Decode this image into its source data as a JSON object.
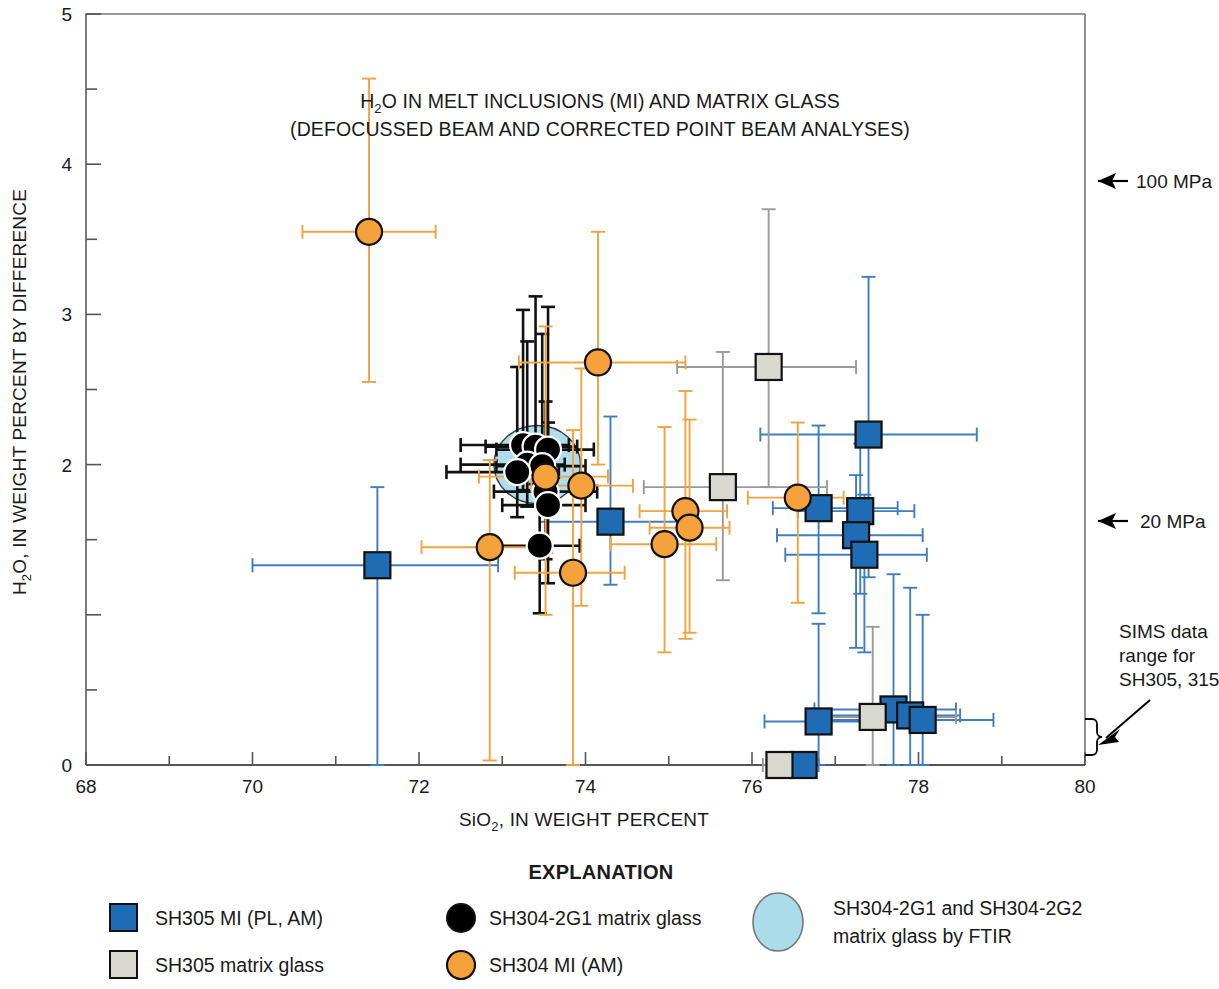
{
  "figure": {
    "title_line1": "H₂O IN MELT INCLUSIONS (MI) AND MATRIX GLASS",
    "title_line1_pre": "H",
    "title_line1_sub": "2",
    "title_line1_post": "O IN MELT INCLUSIONS (MI) AND MATRIX GLASS",
    "title_line2": "(DEFOCUSSED BEAM AND CORRECTED POINT BEAM ANALYSES)"
  },
  "axes": {
    "x_label_pre": "SiO",
    "x_label_sub": "2",
    "x_label_post": ", IN WEIGHT PERCENT",
    "y_label_pre": "H",
    "y_label_sub": "2",
    "y_label_post": "O, IN WEIGHT PERCENT BY DIFFERENCE",
    "x_ticks_labeled": [
      "68",
      "70",
      "72",
      "74",
      "76",
      "78",
      "80"
    ],
    "y_ticks_labeled": [
      "0",
      "2",
      "3",
      "4",
      "5"
    ]
  },
  "annotations": {
    "pressure_100": "100 MPa",
    "pressure_20": "20 MPa",
    "sims_line1": "SIMS data",
    "sims_line2": "range for",
    "sims_line3": "SH305, 315"
  },
  "legend": {
    "title": "EXPLANATION",
    "items": [
      {
        "key": "sh305-mi",
        "label": "SH305 MI (PL, AM)",
        "shape": "square",
        "color": "#1f6cb4"
      },
      {
        "key": "sh305-matrix",
        "label": "SH305 matrix glass",
        "shape": "square",
        "color": "#d9d8cf"
      },
      {
        "key": "sh304-2g1-matrix",
        "label": "SH304-2G1 matrix glass",
        "shape": "circle",
        "color": "#000000"
      },
      {
        "key": "sh304-mi",
        "label": "SH304 MI (AM)",
        "shape": "circle",
        "color": "#f5a23c"
      },
      {
        "key": "ftir-field",
        "label_line1": "SH304-2G1 and SH304-2G2",
        "label_line2": "matrix glass by FTIR",
        "shape": "ellipse",
        "color": "#abdcea"
      }
    ]
  },
  "colors": {
    "blue": "#1f6cb4",
    "blue_bar": "#3e7dc0",
    "gray": "#d9d8cf",
    "gray_bar": "#9a9a9a",
    "orange": "#f5a23c",
    "orange_bar": "#f2a33f",
    "black": "#000000",
    "ftir_fill": "#abdcea",
    "axis": "#666666"
  },
  "chart_data": {
    "type": "scatter",
    "title": "H2O IN MELT INCLUSIONS (MI) AND MATRIX GLASS (DEFOCUSSED BEAM AND CORRECTED POINT BEAM ANALYSES)",
    "xlabel": "SiO2, IN WEIGHT PERCENT",
    "ylabel": "H2O, IN WEIGHT PERCENT BY DIFFERENCE",
    "xlim": [
      68,
      80
    ],
    "ylim": [
      0,
      5
    ],
    "x_major_step": 2,
    "x_minor_step": 1,
    "y_major_step": 1,
    "y_minor_step": 0.5,
    "grid": false,
    "legend_position": "below-plot",
    "ftir_field": {
      "cx": 73.42,
      "cy": 2.0,
      "rx": 0.52,
      "ry": 0.26,
      "fill": "#abdcea",
      "note": "SH304-2G1 and SH304-2G2 matrix glass by FTIR"
    },
    "series": [
      {
        "name": "SH305 MI (PL, AM)",
        "marker": "square",
        "color": "#1f6cb4",
        "points": [
          {
            "x": 71.5,
            "y": 1.33,
            "xerr": [
              1.5,
              1.45
            ],
            "yerr": [
              1.33,
              0.52
            ]
          },
          {
            "x": 74.3,
            "y": 1.62,
            "xerr": [
              0.85,
              0.8
            ],
            "yerr": [
              0.42,
              0.7
            ]
          },
          {
            "x": 77.4,
            "y": 2.2,
            "xerr": [
              1.3,
              1.3
            ],
            "yerr": [
              0.95,
              1.05
            ]
          },
          {
            "x": 76.8,
            "y": 1.71,
            "xerr": [
              0.55,
              0.95
            ],
            "yerr": [
              0.7,
              0.55
            ]
          },
          {
            "x": 77.3,
            "y": 1.69,
            "xerr": [
              0.75,
              0.65
            ],
            "yerr": [
              0.55,
              0.45
            ]
          },
          {
            "x": 77.25,
            "y": 1.53,
            "xerr": [
              0.95,
              0.8
            ],
            "yerr": [
              0.75,
              0.4
            ]
          },
          {
            "x": 77.35,
            "y": 1.4,
            "xerr": [
              0.95,
              0.75
            ],
            "yerr": [
              0.65,
              0.4
            ]
          },
          {
            "x": 77.7,
            "y": 0.37,
            "xerr": [
              0.95,
              0.75
            ],
            "yerr": [
              0.37,
              0.9
            ]
          },
          {
            "x": 77.9,
            "y": 0.33,
            "xerr": [
              1.0,
              0.6
            ],
            "yerr": [
              0.33,
              0.85
            ]
          },
          {
            "x": 78.05,
            "y": 0.3,
            "xerr": [
              1.2,
              0.85
            ],
            "yerr": [
              0.3,
              0.7
            ]
          },
          {
            "x": 76.8,
            "y": 0.29,
            "xerr": [
              0.65,
              1.0
            ],
            "yerr": [
              0.29,
              0.65
            ]
          },
          {
            "x": 76.62,
            "y": 0.0,
            "xerr": [
              0.2,
              0.18
            ],
            "yerr": [
              0.0,
              0.0
            ]
          }
        ]
      },
      {
        "name": "SH305 matrix glass",
        "marker": "square",
        "color": "#d9d8cf",
        "points": [
          {
            "x": 76.2,
            "y": 2.65,
            "xerr": [
              1.1,
              1.05
            ],
            "yerr": [
              0.8,
              1.05
            ]
          },
          {
            "x": 75.65,
            "y": 1.85,
            "xerr": [
              0.95,
              1.25
            ],
            "yerr": [
              0.62,
              0.9
            ]
          },
          {
            "x": 77.45,
            "y": 0.32,
            "xerr": [
              0.75,
              1.0
            ],
            "yerr": [
              0.32,
              0.6
            ]
          },
          {
            "x": 76.33,
            "y": 0.0,
            "xerr": [
              0.2,
              0.18
            ],
            "yerr": [
              0.0,
              0.0
            ]
          }
        ]
      },
      {
        "name": "SH304-2G1 matrix glass",
        "marker": "circle",
        "color": "#000000",
        "points": [
          {
            "x": 73.25,
            "y": 2.13,
            "xerr": [
              0.75,
              0.55
            ],
            "yerr": [
              0.3,
              0.9
            ]
          },
          {
            "x": 73.4,
            "y": 2.12,
            "xerr": [
              0.6,
              0.5
            ],
            "yerr": [
              0.25,
              1.0
            ]
          },
          {
            "x": 73.55,
            "y": 2.1,
            "xerr": [
              0.62,
              0.55
            ],
            "yerr": [
              0.32,
              0.95
            ]
          },
          {
            "x": 73.3,
            "y": 2.0,
            "xerr": [
              0.8,
              0.45
            ],
            "yerr": [
              0.28,
              0.82
            ]
          },
          {
            "x": 73.48,
            "y": 1.99,
            "xerr": [
              0.55,
              0.52
            ],
            "yerr": [
              0.25,
              0.88
            ]
          },
          {
            "x": 73.18,
            "y": 1.95,
            "xerr": [
              0.85,
              0.5
            ],
            "yerr": [
              0.3,
              0.7
            ]
          },
          {
            "x": 73.52,
            "y": 1.82,
            "xerr": [
              0.62,
              0.62
            ],
            "yerr": [
              0.45,
              0.6
            ]
          },
          {
            "x": 73.55,
            "y": 1.73,
            "xerr": [
              0.55,
              0.45
            ],
            "yerr": [
              0.52,
              0.55
            ]
          },
          {
            "x": 73.45,
            "y": 1.46,
            "xerr": [
              0.58,
              0.48
            ],
            "yerr": [
              0.45,
              0.4
            ]
          }
        ]
      },
      {
        "name": "SH304 MI (AM)",
        "marker": "circle",
        "color": "#f5a23c",
        "points": [
          {
            "x": 71.4,
            "y": 3.55,
            "xerr": [
              0.8,
              0.8
            ],
            "yerr": [
              1.0,
              1.02
            ]
          },
          {
            "x": 74.15,
            "y": 2.68,
            "xerr": [
              0.95,
              1.05
            ],
            "yerr": [
              0.68,
              0.87
            ]
          },
          {
            "x": 73.52,
            "y": 1.92,
            "xerr": [
              0.8,
              0.75
            ],
            "yerr": [
              0.92,
              1.0
            ]
          },
          {
            "x": 73.95,
            "y": 1.86,
            "xerr": [
              0.6,
              0.62
            ],
            "yerr": [
              0.8,
              0.78
            ]
          },
          {
            "x": 76.55,
            "y": 1.78,
            "xerr": [
              0.6,
              0.55
            ],
            "yerr": [
              0.7,
              0.5
            ]
          },
          {
            "x": 75.2,
            "y": 1.69,
            "xerr": [
              0.55,
              0.5
            ],
            "yerr": [
              0.85,
              0.8
            ]
          },
          {
            "x": 75.25,
            "y": 1.58,
            "xerr": [
              0.48,
              0.48
            ],
            "yerr": [
              0.7,
              0.72
            ]
          },
          {
            "x": 74.95,
            "y": 1.47,
            "xerr": [
              0.65,
              0.62
            ],
            "yerr": [
              0.72,
              0.78
            ]
          },
          {
            "x": 72.85,
            "y": 1.45,
            "xerr": [
              0.82,
              0.75
            ],
            "yerr": [
              1.42,
              0.58
            ]
          },
          {
            "x": 73.85,
            "y": 1.28,
            "xerr": [
              0.7,
              0.62
            ],
            "yerr": [
              1.28,
              0.95
            ]
          }
        ]
      }
    ]
  }
}
